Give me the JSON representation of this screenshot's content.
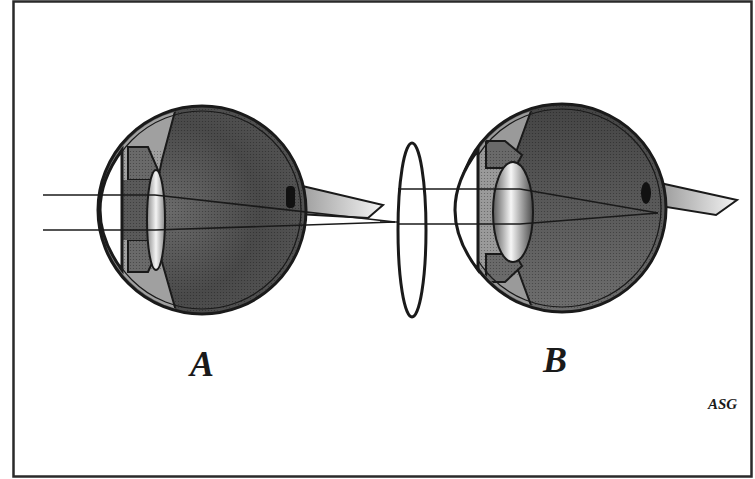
{
  "figure": {
    "panels": [
      {
        "id": "A",
        "label": "A",
        "description": "Hyperopic eye: parallel rays focus behind the retina"
      },
      {
        "id": "B",
        "label": "B",
        "description": "Converging (convex) lens corrects focus onto the retina"
      }
    ],
    "credit": "ASG",
    "colors": {
      "frame": "#2a2a2a",
      "outline": "#1a1a1a",
      "vitreous_dark": "#3c3c3c",
      "vitreous_mid": "#7a7a7a",
      "ciliary": "#9a9a9a",
      "iris": "#6a6a6a",
      "lens_light": "#f2f2f2",
      "nerve_light": "#e8e8e8",
      "background": "#ffffff"
    }
  }
}
